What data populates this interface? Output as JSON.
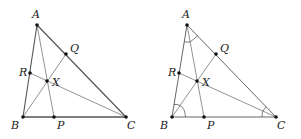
{
  "figures": [
    {
      "id": "left",
      "points": {
        "A": {
          "label": "A",
          "x": 37,
          "y": 25,
          "lx": 31,
          "ly": 15
        },
        "Q": {
          "label": "Q",
          "x": 66,
          "y": 54,
          "lx": 70,
          "ly": 50
        },
        "R": {
          "label": "R",
          "x": 30,
          "y": 73,
          "lx": 19,
          "ly": 74
        },
        "X": {
          "label": "X",
          "x": 47,
          "y": 81,
          "lx": 53,
          "ly": 83
        },
        "B": {
          "label": "B",
          "x": 23,
          "y": 117,
          "lx": 12,
          "ly": 129
        },
        "P": {
          "label": "P",
          "x": 54,
          "y": 117,
          "lx": 58,
          "ly": 129
        },
        "C": {
          "label": "C",
          "x": 126,
          "y": 117,
          "lx": 127,
          "ly": 129
        }
      },
      "angle_marks": false
    },
    {
      "id": "right",
      "points": {
        "A": {
          "label": "A",
          "x": 187,
          "y": 25,
          "lx": 181,
          "ly": 15
        },
        "Q": {
          "label": "Q",
          "x": 216,
          "y": 54,
          "lx": 220,
          "ly": 50
        },
        "R": {
          "label": "R",
          "x": 179,
          "y": 73,
          "lx": 168,
          "ly": 74
        },
        "X": {
          "label": "X",
          "x": 197,
          "y": 81,
          "lx": 203,
          "ly": 83
        },
        "B": {
          "label": "B",
          "x": 172,
          "y": 117,
          "lx": 161,
          "ly": 129
        },
        "P": {
          "label": "P",
          "x": 204,
          "y": 117,
          "lx": 208,
          "ly": 129
        },
        "C": {
          "label": "C",
          "x": 276,
          "y": 117,
          "lx": 277,
          "ly": 129
        }
      },
      "angle_marks": true
    }
  ],
  "segments": [
    "AB",
    "AC",
    "BC",
    "AP",
    "BQ",
    "CR"
  ]
}
